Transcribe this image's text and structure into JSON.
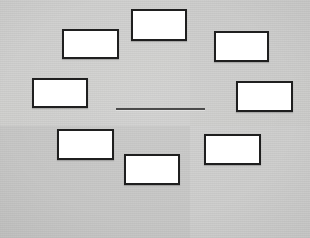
{
  "figure": {
    "title": "",
    "background_color": "#cccccb",
    "box_fill_color": "#ffffff",
    "box_border_color": "#1f1f1f",
    "connector_color": "#4a4a4a",
    "node_count": 8
  },
  "nodes": [
    {
      "id": "node-1",
      "label": "",
      "x": 62,
      "y": 29,
      "w": 57,
      "h": 30
    },
    {
      "id": "node-2",
      "label": "",
      "x": 131,
      "y": 9,
      "w": 56,
      "h": 32
    },
    {
      "id": "node-3",
      "label": "",
      "x": 214,
      "y": 31,
      "w": 55,
      "h": 31
    },
    {
      "id": "node-4",
      "label": "",
      "x": 32,
      "y": 78,
      "w": 56,
      "h": 30
    },
    {
      "id": "node-5",
      "label": "",
      "x": 236,
      "y": 81,
      "w": 57,
      "h": 31
    },
    {
      "id": "node-6",
      "label": "",
      "x": 57,
      "y": 129,
      "w": 57,
      "h": 31
    },
    {
      "id": "node-7",
      "label": "",
      "x": 124,
      "y": 154,
      "w": 56,
      "h": 31
    },
    {
      "id": "node-8",
      "label": "",
      "x": 204,
      "y": 134,
      "w": 57,
      "h": 31
    }
  ],
  "connector": {
    "id": "center-connector",
    "label": "",
    "x": 116,
    "y": 108,
    "w": 89,
    "h": 2
  }
}
